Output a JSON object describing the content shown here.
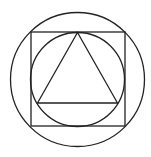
{
  "diagram": {
    "stroke_color": "#222222",
    "background": "#ffffff",
    "shapes": [
      {
        "type": "circle",
        "name": "outer-circle",
        "cx": 77.5,
        "cy": 79.5,
        "r": 67
      },
      {
        "type": "square",
        "name": "square",
        "x": 31,
        "y": 32,
        "size": 94
      },
      {
        "type": "circle",
        "name": "inner-circle",
        "cx": 77.5,
        "cy": 79.5,
        "r": 47
      },
      {
        "type": "triangle",
        "name": "triangle",
        "points": [
          [
            77.5,
            32.5
          ],
          [
            37.5,
            103
          ],
          [
            117.5,
            103
          ]
        ]
      }
    ]
  }
}
